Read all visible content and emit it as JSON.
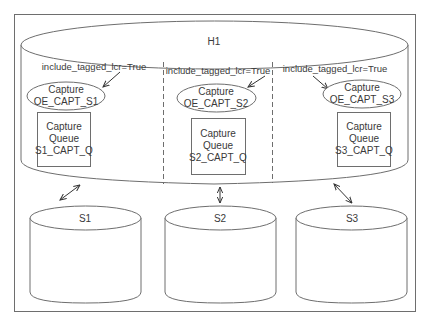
{
  "diagram": {
    "hub": {
      "label": "H1"
    },
    "sites": [
      {
        "rule_label": "include_tagged_lcr=True",
        "capture_line1": "Capture",
        "capture_line2": "OE_CAPT_S1",
        "queue_line1": "Capture",
        "queue_line2": "Queue",
        "queue_line3": "S1_CAPT_Q",
        "db_label": "S1"
      },
      {
        "rule_label": "include_tagged_lcr=True",
        "capture_line1": "Capture",
        "capture_line2": "OE_CAPT_S2",
        "queue_line1": "Capture",
        "queue_line2": "Queue",
        "queue_line3": "S2_CAPT_Q",
        "db_label": "S2"
      },
      {
        "rule_label": "include_tagged_lcr=True",
        "capture_line1": "Capture",
        "capture_line2": "OE_CAPT_S3",
        "queue_line1": "Capture",
        "queue_line2": "Queue",
        "queue_line3": "S3_CAPT_Q",
        "db_label": "S3"
      }
    ],
    "colors": {
      "stroke": "#6e6e6e",
      "text": "#3a3a3a",
      "background": "#ffffff"
    }
  }
}
